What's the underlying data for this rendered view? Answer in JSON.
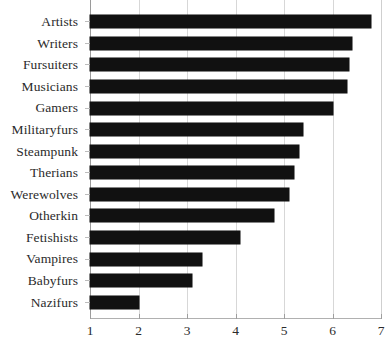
{
  "chart_data": {
    "type": "bar",
    "orientation": "horizontal",
    "title": "",
    "subtitle": "",
    "xlabel": "",
    "ylabel": "",
    "categories": [
      "Artists",
      "Writers",
      "Fursuiters",
      "Musicians",
      "Gamers",
      "Militaryfurs",
      "Steampunk",
      "Therians",
      "Werewolves",
      "Otherkin",
      "Fetishists",
      "Vampires",
      "Babyfurs",
      "Nazifurs"
    ],
    "values": [
      6.8,
      6.4,
      6.35,
      6.3,
      6.0,
      5.4,
      5.3,
      5.2,
      5.1,
      4.8,
      4.1,
      3.3,
      3.1,
      2.0
    ],
    "xlim": [
      1,
      7
    ],
    "xticks": [
      1,
      2,
      3,
      4,
      5,
      6,
      7
    ],
    "xtick_labels": [
      "1",
      "2",
      "3",
      "4",
      "5",
      "6",
      "7"
    ],
    "grid": "vertical",
    "legend": "none",
    "bar_color": "#111111",
    "text_color": "#2b2b2b",
    "grid_color": "#d7d7d7",
    "background": "#ffffff"
  }
}
